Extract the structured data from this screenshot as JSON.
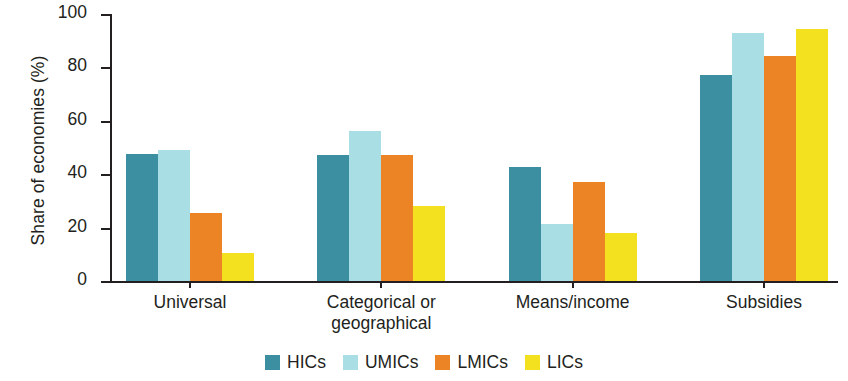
{
  "chart_data": {
    "type": "bar",
    "title": "",
    "subtitle": "",
    "xlabel": "",
    "ylabel": "Share of economies (%)",
    "ylim": [
      0,
      100
    ],
    "yticks": [
      0,
      20,
      40,
      60,
      80,
      100
    ],
    "grid": false,
    "legend_position": "bottom-center",
    "categories": [
      "Universal",
      "Categorical or\ngeographical",
      "Means/income",
      "Subsidies"
    ],
    "series": [
      {
        "name": "HICs",
        "color": "#3b8fa1",
        "values": [
          47.6,
          47.2,
          42.7,
          77.2
        ]
      },
      {
        "name": "UMICs",
        "color": "#a9dee5",
        "values": [
          49.0,
          56.3,
          21.2,
          92.9
        ]
      },
      {
        "name": "LMICs",
        "color": "#ec8426",
        "values": [
          25.6,
          47.2,
          37.2,
          84.3
        ]
      },
      {
        "name": "LICs",
        "color": "#f3e01e",
        "values": [
          10.6,
          28.0,
          18.0,
          94.4
        ]
      }
    ]
  },
  "axis": {
    "y_title": "Share of economies (%)",
    "y_tick_labels": [
      "0",
      "20",
      "40",
      "60",
      "80",
      "100"
    ]
  },
  "legend": {
    "items": [
      {
        "label": "HICs",
        "color": "#3b8fa1"
      },
      {
        "label": "UMICs",
        "color": "#a9dee5"
      },
      {
        "label": "LMICs",
        "color": "#ec8426"
      },
      {
        "label": "LICs",
        "color": "#f3e01e"
      }
    ]
  }
}
